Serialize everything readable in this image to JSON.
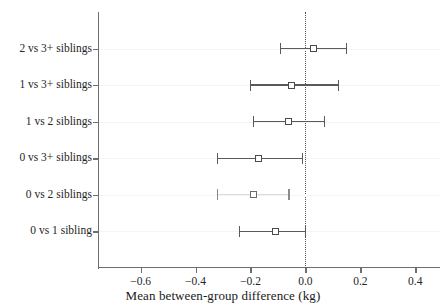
{
  "chart_data": {
    "type": "scatter",
    "title": "",
    "subtitle": "",
    "xlabel": "Mean between-group difference (kg)",
    "ylabel": "",
    "xlim": [
      -0.755,
      0.49
    ],
    "xticks": [
      -0.6,
      -0.4,
      -0.2,
      0.0,
      0.2,
      0.4
    ],
    "xticklabels": [
      "−0.6",
      "−0.4",
      "−0.2",
      "0.0",
      "0.2",
      "0.4"
    ],
    "grid": true,
    "reference_line": 0.0,
    "categories": [
      "2 vs 3+ siblings",
      "1 vs 3+ siblings",
      "1 vs 2 siblings",
      "0 vs 3+ siblings",
      "0 vs 2 siblings",
      "0 vs 1 sibling"
    ],
    "series": [
      {
        "name": "Mean between-group difference (kg)",
        "estimates": [
          0.03,
          -0.05,
          -0.06,
          -0.17,
          -0.19,
          -0.11
        ],
        "ci_low": [
          -0.09,
          -0.2,
          -0.19,
          -0.32,
          -0.32,
          -0.24
        ],
        "ci_high": [
          0.15,
          0.12,
          0.07,
          -0.01,
          -0.06,
          0.0
        ]
      }
    ],
    "points": [
      {
        "label": "2 vs 3+ siblings",
        "estimate": 0.03,
        "ci_low": -0.09,
        "ci_high": 0.15,
        "faint": false
      },
      {
        "label": "1 vs 3+ siblings",
        "estimate": -0.05,
        "ci_low": -0.2,
        "ci_high": 0.12,
        "faint": false
      },
      {
        "label": "1 vs 2 siblings",
        "estimate": -0.06,
        "ci_low": -0.19,
        "ci_high": 0.07,
        "faint": false
      },
      {
        "label": "0 vs 3+ siblings",
        "estimate": -0.17,
        "ci_low": -0.32,
        "ci_high": -0.01,
        "faint": false
      },
      {
        "label": "0 vs 2 siblings",
        "estimate": -0.19,
        "ci_low": -0.32,
        "ci_high": -0.06,
        "faint": true
      },
      {
        "label": "0 vs 1 sibling",
        "estimate": -0.11,
        "ci_low": -0.24,
        "ci_high": 0.0,
        "faint": false
      }
    ],
    "marker_style": "open-square",
    "colors": {
      "axis": "#6e6e6e",
      "marker_edge": "#4a4a4a",
      "marker_fill": "#ffffff",
      "interval": "#5a5a5a",
      "reference": "#555555",
      "grid": "#f4f4f4",
      "text": "#262626"
    }
  }
}
